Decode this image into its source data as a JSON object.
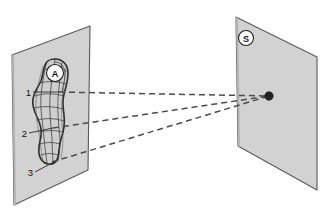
{
  "figure": {
    "title": "",
    "background_color": "#ffffff",
    "width": 325,
    "height": 220
  },
  "planes": [
    {
      "id": "object-plane",
      "name": "left-plane",
      "label": "A",
      "label_role": "object-plane-badge",
      "fill_color": "#d2d2d2",
      "stroke_color": "#5a5a5a",
      "corners": [
        [
          12,
          55
        ],
        [
          90,
          26
        ],
        [
          88,
          170
        ],
        [
          14,
          205
        ]
      ],
      "badge_position": [
        55,
        73
      ],
      "badge_radius": 8.5
    },
    {
      "id": "screen-plane",
      "name": "right-plane",
      "label": "S",
      "label_role": "screen-plane-badge",
      "fill_color": "#d2d2d2",
      "stroke_color": "#5a5a5a",
      "corners": [
        [
          236,
          17
        ],
        [
          317,
          57
        ],
        [
          317,
          190
        ],
        [
          238,
          146
        ]
      ],
      "badge_position": [
        246,
        38
      ],
      "badge_radius": 7.5
    }
  ],
  "object": {
    "name": "deformed-blob",
    "description": "irregular elongated blob with curvilinear mesh",
    "fill_color": "#cfcfcf",
    "stroke_color": "#2d2d2d",
    "outline_path": "M 55 59 C 63 59, 68 65, 68 73 C 68 81, 66 87, 64 94 C 62 101, 63 108, 64 115 C 65 123, 64 131, 61 139 C 59 146, 59 152, 58 157 C 57 162, 53 165, 48 164 C 43 163, 40 159, 39 154 C 38 148, 40 142, 41 136 C 42 129, 40 123, 37 117 C 34 111, 32 105, 33 99 C 34 92, 38 87, 41 81 C 43 76, 43 70, 45 65 C 47 60, 50 59, 55 59 Z",
    "mesh_vertical_paths": [
      "M 47 61 C 44 72, 42 84, 41 96 C 40 110, 43 124, 44 138 C 45 148, 46 156, 47 163",
      "M 55 59 C 53 71, 51 84, 50 97 C 49 111, 51 125, 52 139 C 52 149, 53 157, 53 164",
      "M 62 62 C 61 73, 59 85, 58 98 C 57 112, 59 126, 60 140 C 60 149, 59 156, 58 161"
    ],
    "mesh_horizontal_paths": [
      "M 43 70 C 49 68, 57 68, 66 71",
      "M 40 83 C 47 81, 56 81, 66 84",
      "M 35 96 C 43 93, 54 93, 64 96",
      "M 34 108 C 42 106, 53 106, 63 109",
      "M 37 120 C 45 118, 55 118, 64 121",
      "M 40 132 C 47 130, 56 130, 62 132",
      "M 40 144 C 46 142, 54 142, 60 144",
      "M 41 155 C 46 153, 53 153, 58 155"
    ]
  },
  "source_point": {
    "name": "point-source",
    "label": "",
    "position": [
      269,
      96
    ],
    "radius": 4.2,
    "color": "#232323"
  },
  "rays": [
    {
      "name": "ray-1",
      "from_label": "1",
      "from": [
        59,
        92
      ],
      "to": [
        269,
        96
      ],
      "style": "dashed"
    },
    {
      "name": "ray-2",
      "from_label": "2",
      "from": [
        53,
        128
      ],
      "to": [
        269,
        96
      ],
      "style": "dashed"
    },
    {
      "name": "ray-3",
      "from_label": "3",
      "from": [
        52,
        162
      ],
      "to": [
        269,
        96
      ],
      "style": "dashed"
    }
  ],
  "callouts": [
    {
      "name": "callout-1",
      "label": "1",
      "text_position": [
        30,
        92
      ],
      "leader_from": [
        33,
        92
      ],
      "leader_to": [
        59,
        92
      ]
    },
    {
      "name": "callout-2",
      "label": "2",
      "text_position": [
        26,
        133
      ],
      "leader_from": [
        29,
        133
      ],
      "leader_to": [
        53,
        128
      ]
    },
    {
      "name": "callout-3",
      "label": "3",
      "text_position": [
        32,
        172
      ],
      "leader_from": [
        35,
        172
      ],
      "leader_to": [
        54,
        162
      ]
    }
  ],
  "colors": {
    "plane_fill": "#d2d2d2",
    "plane_stroke": "#5a5a5a",
    "blob_fill": "#cfcfcf",
    "blob_stroke": "#2d2d2d",
    "ray_stroke": "#4b4b4b",
    "text": "#111111",
    "background": "#ffffff"
  }
}
